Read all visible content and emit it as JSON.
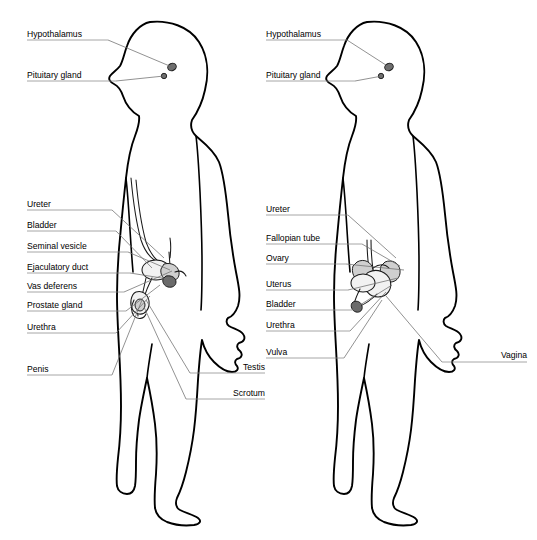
{
  "diagram": {
    "background_color": "#ffffff",
    "outline_color": "#000000",
    "leader_color": "#6e6e6e",
    "label_color": "#000000",
    "figures": [
      {
        "id": "male-figure",
        "name": "male-figure",
        "sex": "male",
        "labels": [
          {
            "id": "hypothalamus",
            "text": "Hypothalamus",
            "align": "left",
            "text_x": 27,
            "text_y": 37,
            "line_x1": 27,
            "line_x2": 108,
            "line_y": 40,
            "leader": "M108,40 L172,67"
          },
          {
            "id": "pituitary-gland",
            "text": "Pituitary gland",
            "align": "left",
            "text_x": 27,
            "text_y": 78,
            "line_x1": 27,
            "line_x2": 116,
            "line_y": 81,
            "leader": "M116,81 L164,76"
          },
          {
            "id": "ureter",
            "text": "Ureter",
            "align": "left",
            "text_x": 27,
            "text_y": 207,
            "line_x1": 27,
            "line_x2": 112,
            "line_y": 210,
            "leader": "M112,210 L164,258"
          },
          {
            "id": "bladder",
            "text": "Bladder",
            "align": "left",
            "text_x": 27,
            "text_y": 228,
            "line_x1": 27,
            "line_x2": 116,
            "line_y": 231,
            "leader": "M116,231 L152,268"
          },
          {
            "id": "seminal-vesicle",
            "text": "Seminal vesicle",
            "align": "left",
            "text_x": 27,
            "text_y": 249,
            "line_x1": 27,
            "line_x2": 128,
            "line_y": 252,
            "leader": "M128,252 L170,270"
          },
          {
            "id": "ejaculatory-duct",
            "text": "Ejaculatory duct",
            "align": "left",
            "text_x": 27,
            "text_y": 270,
            "line_x1": 27,
            "line_x2": 130,
            "line_y": 273,
            "leader": "M130,273 L168,279"
          },
          {
            "id": "vas-deferens",
            "text": "Vas deferens",
            "align": "left",
            "text_x": 27,
            "text_y": 289,
            "line_x1": 27,
            "line_x2": 124,
            "line_y": 292,
            "leader": "M124,292 L172,271"
          },
          {
            "id": "prostate-gland",
            "text": "Prostate gland",
            "align": "left",
            "text_x": 27,
            "text_y": 308,
            "line_x1": 27,
            "line_x2": 126,
            "line_y": 311,
            "leader": "M126,311 L160,285"
          },
          {
            "id": "urethra",
            "text": "Urethra",
            "align": "left",
            "text_x": 27,
            "text_y": 330,
            "line_x1": 27,
            "line_x2": 116,
            "line_y": 333,
            "leader": "M116,333 L150,296"
          },
          {
            "id": "penis",
            "text": "Penis",
            "align": "left",
            "text_x": 27,
            "text_y": 372,
            "line_x1": 27,
            "line_x2": 112,
            "line_y": 375,
            "leader": "M112,375 L142,300"
          },
          {
            "id": "testis",
            "text": "Testis",
            "align": "right",
            "text_x": 265,
            "text_y": 370,
            "line_x1": 190,
            "line_x2": 265,
            "line_y": 373,
            "leader": "M190,373 L146,300"
          },
          {
            "id": "scrotum",
            "text": "Scrotum",
            "align": "right",
            "text_x": 265,
            "text_y": 396,
            "line_x1": 186,
            "line_x2": 265,
            "line_y": 399,
            "leader": "M186,399 L144,307"
          }
        ]
      },
      {
        "id": "female-figure",
        "name": "female-figure",
        "sex": "female",
        "labels": [
          {
            "id": "hypothalamus-f",
            "text": "Hypothalamus",
            "align": "left",
            "text_x": 266,
            "text_y": 37,
            "line_x1": 266,
            "line_x2": 347,
            "line_y": 40,
            "leader": "M347,40 L389,67"
          },
          {
            "id": "pituitary-gland-f",
            "text": "Pituitary gland",
            "align": "left",
            "text_x": 266,
            "text_y": 78,
            "line_x1": 266,
            "line_x2": 355,
            "line_y": 81,
            "leader": "M355,81 L382,76"
          },
          {
            "id": "ureter-f",
            "text": "Ureter",
            "align": "left",
            "text_x": 266,
            "text_y": 212,
            "line_x1": 266,
            "line_x2": 348,
            "line_y": 215,
            "leader": "M348,215 L396,258"
          },
          {
            "id": "fallopian-tube",
            "text": "Fallopian tube",
            "align": "left",
            "text_x": 266,
            "text_y": 241,
            "line_x1": 266,
            "line_x2": 362,
            "line_y": 244,
            "leader": "M362,244 L400,266"
          },
          {
            "id": "ovary",
            "text": "Ovary",
            "align": "left",
            "text_x": 266,
            "text_y": 261,
            "line_x1": 266,
            "line_x2": 346,
            "line_y": 264,
            "leader": "M346,264 L404,270"
          },
          {
            "id": "uterus",
            "text": "Uterus",
            "align": "left",
            "text_x": 266,
            "text_y": 287,
            "line_x1": 266,
            "line_x2": 348,
            "line_y": 290,
            "leader": "M348,290 L398,278"
          },
          {
            "id": "bladder-f",
            "text": "Bladder",
            "align": "left",
            "text_x": 266,
            "text_y": 307,
            "line_x1": 266,
            "line_x2": 352,
            "line_y": 310,
            "leader": "M352,310 L392,285"
          },
          {
            "id": "urethra-f",
            "text": "Urethra",
            "align": "left",
            "text_x": 266,
            "text_y": 328,
            "line_x1": 266,
            "line_x2": 350,
            "line_y": 331,
            "leader": "M350,331 L386,292"
          },
          {
            "id": "vulva",
            "text": "Vulva",
            "align": "left",
            "text_x": 266,
            "text_y": 355,
            "line_x1": 266,
            "line_x2": 344,
            "line_y": 358,
            "leader": "M344,358 L382,300"
          },
          {
            "id": "vagina",
            "text": "Vagina",
            "align": "right",
            "text_x": 527,
            "text_y": 358,
            "line_x1": 442,
            "line_x2": 527,
            "line_y": 362,
            "leader": "M442,362 L386,296"
          }
        ]
      }
    ]
  }
}
